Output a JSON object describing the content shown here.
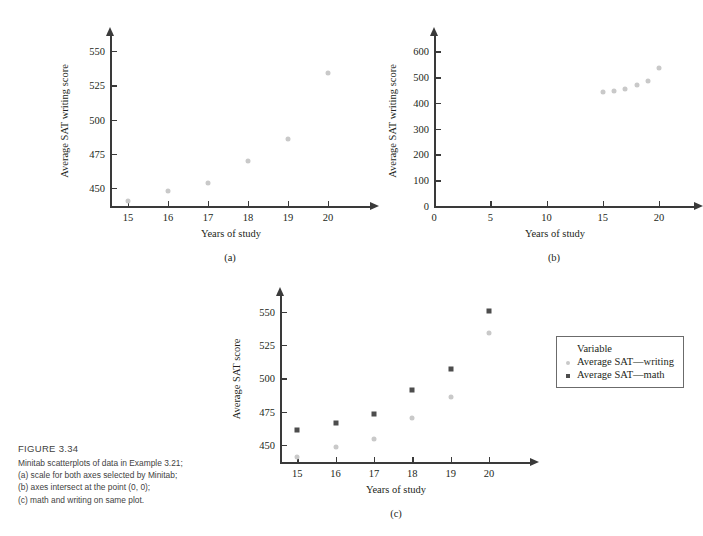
{
  "figure": {
    "number": "FIGURE 3.34",
    "caption_lines": [
      "Minitab scatterplots of data in Example 3.21;",
      "(a) scale for both axes selected by Minitab;",
      "(b) axes intersect at the point (0, 0);",
      "(c) math and writing on same plot."
    ]
  },
  "colors": {
    "writing_marker": "#c9c9c9",
    "math_marker": "#4d4d4d",
    "axis": "#3a3a3a",
    "text": "#231f20",
    "caption_text": "#3f3f3f"
  },
  "chart_data": [
    {
      "id": "a",
      "type": "scatter",
      "sublabel": "(a)",
      "title": "",
      "xlabel": "Years of study",
      "ylabel": "Average SAT writing score",
      "xticks": [
        "15",
        "16",
        "17",
        "18",
        "19",
        "20"
      ],
      "xtickvals": [
        15,
        16,
        17,
        18,
        19,
        20
      ],
      "yticks": [
        "450",
        "475",
        "500",
        "525",
        "550"
      ],
      "ytickvals": [
        450,
        475,
        500,
        525,
        550
      ],
      "xlim": [
        14.55,
        20.6
      ],
      "ylim": [
        437,
        561
      ],
      "grid": false,
      "legend": "none",
      "series": [
        {
          "name": "Average SAT—writing",
          "marker": "dot",
          "x": [
            15,
            16,
            17,
            18,
            19,
            20
          ],
          "values": [
            441,
            448,
            454,
            470,
            486,
            534
          ]
        }
      ]
    },
    {
      "id": "b",
      "type": "scatter",
      "sublabel": "(b)",
      "title": "",
      "xlabel": "Years of study",
      "ylabel": "Average SAT writing score",
      "xticks": [
        "0",
        "5",
        "10",
        "15",
        "20"
      ],
      "xtickvals": [
        0,
        5,
        10,
        15,
        20
      ],
      "yticks": [
        "0",
        "100",
        "200",
        "300",
        "400",
        "500",
        "600"
      ],
      "ytickvals": [
        0,
        100,
        200,
        300,
        400,
        500,
        600
      ],
      "xlim": [
        0,
        21.5
      ],
      "ylim": [
        0,
        660
      ],
      "grid": false,
      "legend": "none",
      "series": [
        {
          "name": "Average SAT—writing",
          "marker": "dot",
          "x": [
            15,
            16,
            17,
            18,
            19,
            20
          ],
          "values": [
            441,
            448,
            454,
            470,
            486,
            534
          ]
        }
      ]
    },
    {
      "id": "c",
      "type": "scatter",
      "sublabel": "(c)",
      "title": "",
      "xlabel": "Years of study",
      "ylabel": "Average SAT score",
      "xticks": [
        "15",
        "16",
        "17",
        "18",
        "19",
        "20"
      ],
      "xtickvals": [
        15,
        16,
        17,
        18,
        19,
        20
      ],
      "yticks": [
        "450",
        "475",
        "500",
        "525",
        "550"
      ],
      "ytickvals": [
        450,
        475,
        500,
        525,
        550
      ],
      "xlim": [
        14.55,
        20.6
      ],
      "ylim": [
        437,
        562
      ],
      "grid": false,
      "legend": "inside-right",
      "legend_title": "Variable",
      "series": [
        {
          "name": "Average SAT—writing",
          "marker": "dot",
          "x": [
            15,
            16,
            17,
            18,
            19,
            20
          ],
          "values": [
            441,
            448,
            454,
            470,
            486,
            534
          ]
        },
        {
          "name": "Average SAT—math",
          "marker": "square",
          "x": [
            15,
            16,
            17,
            18,
            19,
            20
          ],
          "values": [
            461,
            466,
            473,
            491,
            507,
            551
          ]
        }
      ]
    }
  ]
}
